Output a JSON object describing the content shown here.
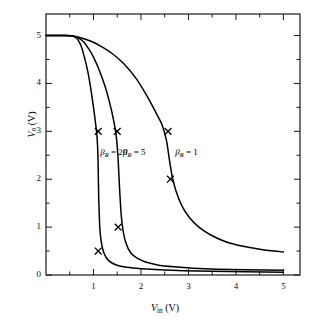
{
  "chart_data": {
    "type": "line",
    "title": "",
    "xlabel": "V_in (V)",
    "ylabel": "V_o (V)",
    "xlim": [
      0,
      5.35
    ],
    "ylim": [
      0,
      5.45
    ],
    "grid": false,
    "legend_position": "inline-annotations",
    "x_major_ticks": [
      1,
      2,
      3,
      4,
      5
    ],
    "x_tick_labels": [
      "1",
      "2",
      "3",
      "4",
      "5"
    ],
    "x_minor_ticks": [
      0.5,
      1.5,
      2.5,
      3.5,
      4.5
    ],
    "y_major_ticks": [
      0,
      1,
      2,
      3,
      4,
      5
    ],
    "y_tick_labels": [
      "0",
      "1",
      "2",
      "3",
      "4",
      "5"
    ],
    "y_minor_ticks": [
      0.5,
      1.5,
      2.5,
      3.5,
      4.5
    ],
    "series": [
      {
        "name": "beta_R = 20",
        "x": [
          0.0,
          0.4,
          0.55,
          0.62,
          0.68,
          0.74,
          0.8,
          0.88,
          0.95,
          1.0,
          1.04,
          1.07,
          1.09,
          1.1,
          1.11,
          1.13,
          1.16,
          1.22,
          1.32,
          1.48,
          1.7,
          2.0,
          2.4,
          2.9,
          3.5,
          4.2,
          5.0
        ],
        "y": [
          5.0,
          5.0,
          4.99,
          4.96,
          4.9,
          4.78,
          4.58,
          4.25,
          3.85,
          3.5,
          3.2,
          2.95,
          2.6,
          2.2,
          1.6,
          1.05,
          0.72,
          0.46,
          0.3,
          0.21,
          0.16,
          0.13,
          0.11,
          0.09,
          0.08,
          0.07,
          0.06
        ],
        "markers": [
          {
            "x": 1.1,
            "y": 3.0
          },
          {
            "x": 1.1,
            "y": 0.5
          }
        ]
      },
      {
        "name": "beta_R = 5",
        "x": [
          0.0,
          0.4,
          0.58,
          0.68,
          0.78,
          0.9,
          1.0,
          1.12,
          1.24,
          1.34,
          1.42,
          1.48,
          1.52,
          1.55,
          1.58,
          1.62,
          1.68,
          1.78,
          1.92,
          2.1,
          2.35,
          2.7,
          3.1,
          3.6,
          4.2,
          5.0
        ],
        "y": [
          5.0,
          5.0,
          4.99,
          4.95,
          4.88,
          4.72,
          4.55,
          4.28,
          3.95,
          3.6,
          3.25,
          2.9,
          2.4,
          1.8,
          1.3,
          0.95,
          0.68,
          0.47,
          0.35,
          0.27,
          0.21,
          0.17,
          0.14,
          0.12,
          0.11,
          0.1
        ],
        "markers": [
          {
            "x": 1.5,
            "y": 3.0
          },
          {
            "x": 1.52,
            "y": 1.0
          }
        ]
      },
      {
        "name": "beta_R = 1",
        "x": [
          0.0,
          0.45,
          0.62,
          0.78,
          0.95,
          1.15,
          1.4,
          1.65,
          1.9,
          2.12,
          2.3,
          2.44,
          2.54,
          2.6,
          2.66,
          2.74,
          2.86,
          3.02,
          3.22,
          3.48,
          3.8,
          4.15,
          4.5,
          4.8,
          5.0
        ],
        "y": [
          5.0,
          5.0,
          4.98,
          4.94,
          4.88,
          4.78,
          4.62,
          4.4,
          4.1,
          3.75,
          3.42,
          3.15,
          2.8,
          2.4,
          2.05,
          1.75,
          1.45,
          1.2,
          1.0,
          0.83,
          0.69,
          0.6,
          0.54,
          0.5,
          0.48
        ],
        "markers": [
          {
            "x": 2.57,
            "y": 3.0
          },
          {
            "x": 2.62,
            "y": 2.0
          }
        ]
      }
    ],
    "annotations": [
      {
        "id": "beta20",
        "symbol": "β",
        "subscript": "R",
        "equals": "=",
        "value": "20",
        "x": 1.1,
        "y": 2.55
      },
      {
        "id": "beta5",
        "symbol": "β",
        "subscript": "R",
        "equals": "=",
        "value": "5",
        "x": 1.58,
        "y": 2.55
      },
      {
        "id": "beta1",
        "symbol": "β",
        "subscript": "R",
        "equals": "=",
        "value": "1",
        "x": 2.68,
        "y": 2.55
      }
    ],
    "axis_title_x": {
      "symbol": "V",
      "subscript": "in",
      "unit": "(V)"
    },
    "axis_title_y": {
      "symbol": "V",
      "subscript": "o",
      "unit": "(V)"
    },
    "colors": {
      "curve": "#000000",
      "frame": "#1a1a1a",
      "background": "#ffffff",
      "text": "#111111"
    }
  }
}
